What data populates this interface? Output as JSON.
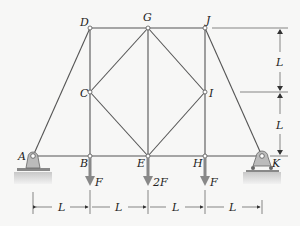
{
  "figure": {
    "type": "truss",
    "joints": {
      "A": "A",
      "B": "B",
      "C": "C",
      "D": "D",
      "E": "E",
      "G": "G",
      "H": "H",
      "I": "I",
      "J": "J",
      "K": "K"
    },
    "loads": {
      "B": "F",
      "E": "2F",
      "H": "F"
    },
    "dimensions": {
      "horizontal": [
        "L",
        "L",
        "L",
        "L"
      ],
      "vertical": [
        "L",
        "L"
      ]
    },
    "colors": {
      "member": "#555555",
      "load_arrow": "#777777",
      "support": "#aaaaaa",
      "background": "#f7f7f6"
    }
  }
}
